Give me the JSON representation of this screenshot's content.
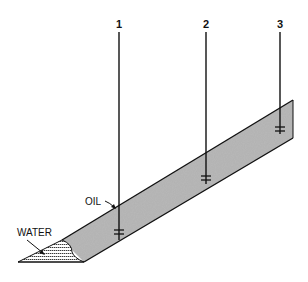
{
  "diagram": {
    "type": "cross-section of inclined reservoir with wells",
    "colors": {
      "oil_fill": "#b8b8b8",
      "line": "#111111",
      "background": "#ffffff"
    },
    "wells": [
      {
        "label": "1",
        "x": 119,
        "perf_y": 232
      },
      {
        "label": "2",
        "x": 206,
        "perf_y": 178
      },
      {
        "label": "3",
        "x": 280,
        "perf_y": 129
      }
    ],
    "labels": {
      "oil": "OIL",
      "water": "WATER"
    }
  }
}
